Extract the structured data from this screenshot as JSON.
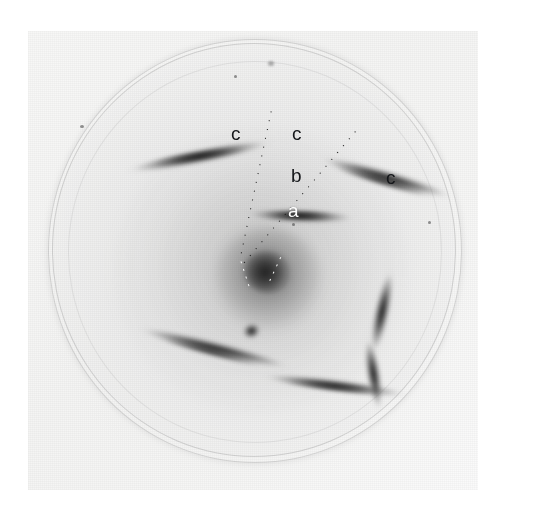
{
  "figure": {
    "kind": "x-ray-diffraction-photograph",
    "background_color": "#ffffff",
    "print_color": "#f6f6f5",
    "streak_color": "#141414"
  },
  "annotations": {
    "labels": [
      {
        "id": "c-left",
        "text": "c",
        "color": "#15171a",
        "x": 231,
        "y": 124
      },
      {
        "id": "c-middle",
        "text": "c",
        "color": "#15171a",
        "x": 292,
        "y": 124
      },
      {
        "id": "b",
        "text": "b",
        "color": "#15171a",
        "x": 291,
        "y": 166
      },
      {
        "id": "a",
        "text": "a",
        "color": "#ffffff",
        "x": 288,
        "y": 201
      },
      {
        "id": "c-right",
        "text": "c",
        "color": "#15171a",
        "x": 386,
        "y": 168
      }
    ],
    "guide_lines": [
      {
        "id": "guide-left",
        "style": "dotted",
        "color": "#111111"
      },
      {
        "id": "guide-right",
        "style": "dotted",
        "color": "#111111"
      }
    ]
  },
  "features": {
    "beam_center": {
      "x": 268,
      "y": 272
    },
    "streaks": [
      {
        "id": "streak-upper-left",
        "label": "c"
      },
      {
        "id": "streak-upper-right",
        "label": "c"
      },
      {
        "id": "streak-layer-line-a",
        "label": "a"
      },
      {
        "id": "streak-lower-left",
        "label": ""
      },
      {
        "id": "streak-lower-right",
        "label": ""
      },
      {
        "id": "streak-right-arc",
        "label": ""
      }
    ]
  }
}
